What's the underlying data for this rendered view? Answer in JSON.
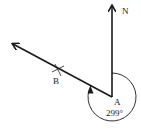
{
  "diagram": {
    "type": "bearing",
    "points": {
      "A": {
        "label": "A",
        "x": 112,
        "y": 97
      },
      "B": {
        "label": "B",
        "x": 58,
        "y": 70
      }
    },
    "north_label": "N",
    "bearing_label": "299°",
    "bearing_degrees": 299,
    "line_color": "#1a1a1a"
  }
}
